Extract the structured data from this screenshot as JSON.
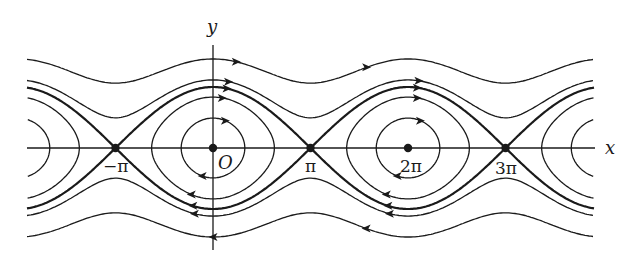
{
  "figure": {
    "axes": {
      "x_label": "x",
      "y_label": "y",
      "origin_label": "O"
    },
    "tick_labels": [
      {
        "value": -3.14159,
        "text": "−π"
      },
      {
        "value": 3.14159,
        "text": "π"
      },
      {
        "value": 6.28319,
        "text": "2π"
      },
      {
        "value": 9.42478,
        "text": "3π"
      }
    ],
    "fixed_points": {
      "centers": [
        0,
        6.28319
      ],
      "saddles": [
        -3.14159,
        3.14159,
        9.42478
      ]
    },
    "orbits": {
      "open_energies": [
        3.26,
        1.49
      ],
      "separatrix_energy": 1.0,
      "closed_energies": [
        0.395,
        -0.52
      ]
    },
    "colors": {
      "ink": "#1a1a1a",
      "background": "#ffffff"
    }
  }
}
